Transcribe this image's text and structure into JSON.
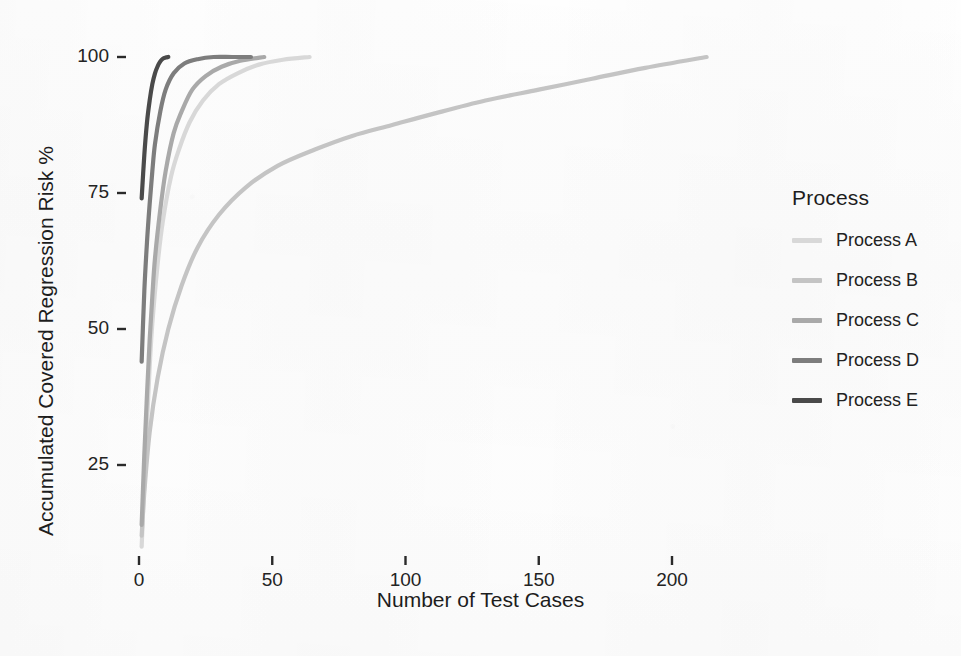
{
  "chart_data": {
    "type": "line",
    "title": "",
    "xlabel": "Number of Test Cases",
    "ylabel": "Accumulated Covered Regression Risk %",
    "xlim": [
      0,
      220
    ],
    "ylim": [
      0,
      105
    ],
    "xticks": [
      0,
      50,
      100,
      150,
      200
    ],
    "yticks": [
      25,
      50,
      75,
      100
    ],
    "grid": false,
    "legend_position": "right",
    "legend_title": "Process",
    "series": [
      {
        "name": "Process A",
        "color": "#d8d8d8",
        "points": [
          [
            1,
            10
          ],
          [
            2,
            22
          ],
          [
            3,
            33
          ],
          [
            4,
            43
          ],
          [
            5,
            51
          ],
          [
            7,
            62
          ],
          [
            9,
            70
          ],
          [
            12,
            78
          ],
          [
            15,
            83
          ],
          [
            19,
            88
          ],
          [
            24,
            92
          ],
          [
            30,
            95
          ],
          [
            37,
            97
          ],
          [
            45,
            98.6
          ],
          [
            54,
            99.5
          ],
          [
            64,
            100
          ]
        ]
      },
      {
        "name": "Process B",
        "color": "#c4c4c4",
        "points": [
          [
            1,
            12
          ],
          [
            2,
            20
          ],
          [
            4,
            31
          ],
          [
            7,
            41
          ],
          [
            11,
            50
          ],
          [
            16,
            58
          ],
          [
            22,
            65
          ],
          [
            30,
            71
          ],
          [
            40,
            76
          ],
          [
            52,
            80
          ],
          [
            66,
            83
          ],
          [
            80,
            85.5
          ],
          [
            95,
            87.5
          ],
          [
            110,
            89.5
          ],
          [
            130,
            92
          ],
          [
            150,
            94
          ],
          [
            170,
            96
          ],
          [
            190,
            98
          ],
          [
            213,
            100
          ]
        ]
      },
      {
        "name": "Process C",
        "color": "#a9a9a9",
        "points": [
          [
            1,
            14
          ],
          [
            2,
            27
          ],
          [
            3,
            38
          ],
          [
            4,
            48
          ],
          [
            5,
            56
          ],
          [
            6,
            63
          ],
          [
            8,
            72
          ],
          [
            10,
            79
          ],
          [
            13,
            86
          ],
          [
            16,
            90
          ],
          [
            20,
            94
          ],
          [
            25,
            96.5
          ],
          [
            31,
            98.2
          ],
          [
            38,
            99.3
          ],
          [
            47,
            100
          ]
        ]
      },
      {
        "name": "Process D",
        "color": "#7d7d7d",
        "points": [
          [
            1,
            44
          ],
          [
            2,
            57
          ],
          [
            3,
            66
          ],
          [
            4,
            73
          ],
          [
            5,
            79
          ],
          [
            6,
            84
          ],
          [
            8,
            90
          ],
          [
            10,
            94
          ],
          [
            13,
            97
          ],
          [
            17,
            98.8
          ],
          [
            22,
            99.6
          ],
          [
            28,
            100
          ],
          [
            35,
            100
          ],
          [
            42,
            100
          ]
        ]
      },
      {
        "name": "Process E",
        "color": "#4a4a4a",
        "points": [
          [
            1,
            74
          ],
          [
            2,
            82
          ],
          [
            3,
            88
          ],
          [
            4,
            92
          ],
          [
            5,
            95
          ],
          [
            6,
            97
          ],
          [
            7,
            98.3
          ],
          [
            8,
            99.2
          ],
          [
            9,
            99.7
          ],
          [
            10,
            99.9
          ],
          [
            11,
            100
          ]
        ]
      }
    ]
  },
  "axes": {
    "x_title": "Number of Test Cases",
    "y_title": "Accumulated Covered Regression Risk %",
    "x_tick_labels": [
      "0",
      "50",
      "100",
      "150",
      "200"
    ],
    "y_tick_labels": [
      "25",
      "50",
      "75",
      "100"
    ]
  },
  "legend": {
    "title": "Process",
    "items": [
      {
        "label": "Process A",
        "color": "#d8d8d8"
      },
      {
        "label": "Process B",
        "color": "#c4c4c4"
      },
      {
        "label": "Process C",
        "color": "#a9a9a9"
      },
      {
        "label": "Process D",
        "color": "#7d7d7d"
      },
      {
        "label": "Process E",
        "color": "#4a4a4a"
      }
    ]
  }
}
